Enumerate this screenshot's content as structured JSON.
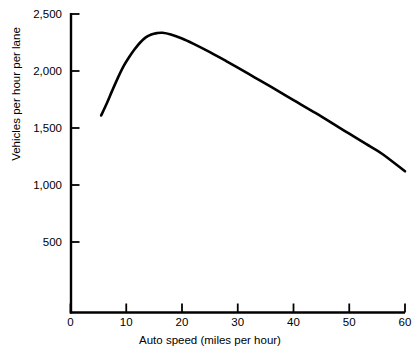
{
  "chart_data": {
    "type": "line",
    "title": "",
    "subtitle": "",
    "xlabel": "Auto speed (miles per hour)",
    "ylabel": "Vehicles per hour per lane",
    "xlim": [
      0,
      60
    ],
    "ylim": [
      0,
      2500
    ],
    "xticks": [
      0,
      10,
      20,
      30,
      40,
      50,
      60
    ],
    "xtick_labels": [
      "0",
      "10",
      "20",
      "30",
      "40",
      "50",
      "60"
    ],
    "yticks": [
      500,
      1000,
      1500,
      2000,
      2500
    ],
    "ytick_labels": [
      "500",
      "1,000",
      "1,500",
      "2,000",
      "2,500"
    ],
    "grid": false,
    "legend": null,
    "line_color": "#000000",
    "line_width": 2.6,
    "background_color": "#ffffff",
    "axis_color": "#000000",
    "annotations": [],
    "series": [
      {
        "name": "Lane capacity vs speed",
        "x": [
          5.5,
          6.5,
          7.5,
          8.5,
          9.5,
          10.5,
          11.5,
          12.5,
          13.5,
          14.5,
          15.5,
          16.5,
          18,
          20,
          22,
          25,
          28,
          30,
          33,
          36,
          40,
          44,
          48,
          50,
          53,
          56,
          60
        ],
        "y": [
          1610,
          1715,
          1830,
          1940,
          2040,
          2120,
          2190,
          2250,
          2295,
          2320,
          2332,
          2335,
          2320,
          2285,
          2240,
          2165,
          2085,
          2030,
          1945,
          1860,
          1745,
          1630,
          1510,
          1450,
          1360,
          1270,
          1120
        ]
      }
    ]
  },
  "axes": {
    "x_axis_name": "horizontal-axis",
    "y_axis_name": "vertical-axis"
  }
}
